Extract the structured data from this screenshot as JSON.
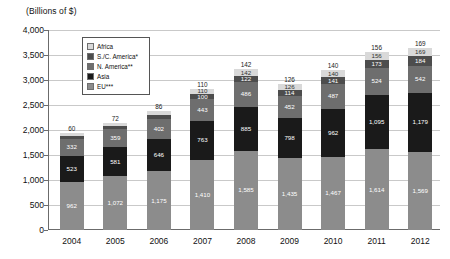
{
  "axis_title": "(Billions of $)",
  "legend": {
    "items": [
      {
        "label": "Africa",
        "color": "#d9d9d9"
      },
      {
        "label": "S./C. America*",
        "color": "#4d4d4d"
      },
      {
        "label": "N. America**",
        "color": "#6e6e6e"
      },
      {
        "label": "Asia",
        "color": "#1a1a1a"
      },
      {
        "label": "EU***",
        "color": "#8c8c8c"
      }
    ]
  },
  "chart_data": {
    "type": "bar",
    "title": "",
    "subtitle": "",
    "xlabel": "",
    "ylabel": "(Billions of $)",
    "ylim": [
      0,
      4000
    ],
    "yticks": [
      "0",
      "500",
      "1,000",
      "1,500",
      "2,000",
      "2,500",
      "3,000",
      "3,500",
      "4,000"
    ],
    "grid": true,
    "legend_position": "inside-top-left",
    "stacked": true,
    "categories": [
      "2004",
      "2005",
      "2006",
      "2007",
      "2008",
      "2009",
      "2010",
      "2011",
      "2012"
    ],
    "series": [
      {
        "name": "EU***",
        "color": "#8c8c8c",
        "values": [
          962,
          1072,
          1175,
          1410,
          1585,
          1435,
          1467,
          1614,
          1569
        ],
        "labels": [
          "962",
          "1,072",
          "1,175",
          "1,410",
          "1,585",
          "1,435",
          "1,467",
          "1,614",
          "1,569"
        ]
      },
      {
        "name": "Asia",
        "color": "#1a1a1a",
        "values": [
          523,
          581,
          646,
          763,
          885,
          798,
          962,
          1095,
          1179
        ],
        "labels": [
          "523",
          "581",
          "646",
          "763",
          "885",
          "798",
          "962",
          "1,095",
          "1,179"
        ]
      },
      {
        "name": "N. America**",
        "color": "#6e6e6e",
        "values": [
          332,
          359,
          402,
          443,
          486,
          452,
          487,
          524,
          542
        ],
        "labels": [
          "332",
          "359",
          "402",
          "443",
          "486",
          "452",
          "487",
          "524",
          "542"
        ]
      },
      {
        "name": "S./C. America*",
        "color": "#4d4d4d",
        "values": [
          56,
          66,
          81,
          100,
          122,
          114,
          141,
          173,
          184
        ],
        "labels": [
          "56",
          "66",
          "81",
          "100",
          "122",
          "114",
          "141",
          "173",
          "184"
        ]
      },
      {
        "name": "Africa",
        "color": "#d9d9d9",
        "values": [
          60,
          72,
          86,
          110,
          142,
          126,
          140,
          156,
          169
        ],
        "labels": [
          "60",
          "72",
          "86",
          "110",
          "142",
          "126",
          "140",
          "156",
          "169"
        ]
      }
    ],
    "top_labels": [
      "60",
      "72",
      "86",
      "110",
      "142",
      "126",
      "140",
      "156",
      "169"
    ]
  }
}
